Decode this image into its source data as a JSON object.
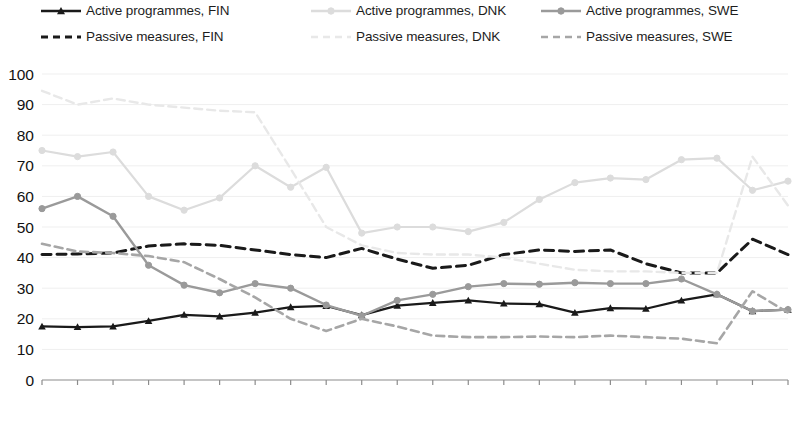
{
  "chart_data": {
    "type": "line",
    "title": "",
    "subtitle": "",
    "xlabel": "",
    "ylabel": "",
    "ylim": [
      0,
      100
    ],
    "ytick_step": 10,
    "yticks": [
      "0",
      "10",
      "20",
      "30",
      "40",
      "50",
      "60",
      "70",
      "80",
      "90",
      "100"
    ],
    "grid": true,
    "grid_axis": "y",
    "legend_position": "top",
    "legend_columns": 3,
    "legend_rows": 2,
    "categories": [
      "2000",
      "2001",
      "2002",
      "2003",
      "2004",
      "2005",
      "2006",
      "2007",
      "2008",
      "2009",
      "2010",
      "2011",
      "2012",
      "2013",
      "2014",
      "2015",
      "2016",
      "2017",
      "2018",
      "2019",
      "2020",
      "2021"
    ],
    "xtick_rotation": 90,
    "series": [
      {
        "name": "Active programmes, FIN",
        "key": "active_fin",
        "color": "#1a1a1a",
        "style": "solid",
        "marker": "triangle",
        "width": 2.2,
        "values": [
          17.5,
          17.3,
          17.5,
          19.3,
          21.3,
          20.8,
          22.0,
          23.8,
          24.2,
          21.2,
          24.3,
          25.2,
          26.0,
          25.0,
          24.8,
          22.0,
          23.5,
          23.3,
          26.0,
          28.0,
          22.5,
          23.0
        ]
      },
      {
        "name": "Passive measures, FIN",
        "key": "passive_fin",
        "color": "#1a1a1a",
        "style": "dashed",
        "marker": "none",
        "width": 3.0,
        "values": [
          41.0,
          41.2,
          41.5,
          43.8,
          44.5,
          44.0,
          42.5,
          41.0,
          40.0,
          43.0,
          39.5,
          36.5,
          37.5,
          41.0,
          42.5,
          42.0,
          42.5,
          38.0,
          35.0,
          35.0,
          46.0,
          41.0
        ]
      },
      {
        "name": "Active programmes, DNK",
        "key": "active_dnk",
        "color": "#dcdcdc",
        "style": "solid",
        "marker": "circle",
        "width": 2.2,
        "values": [
          75.0,
          73.0,
          74.5,
          60.0,
          55.5,
          59.5,
          70.0,
          63.0,
          69.5,
          48.0,
          50.0,
          50.0,
          48.5,
          51.5,
          59.0,
          64.5,
          66.0,
          65.5,
          72.0,
          72.5,
          62.0,
          65.0
        ]
      },
      {
        "name": "Passive measures, DNK",
        "key": "passive_dnk",
        "color": "#e8e8e8",
        "style": "dashed",
        "marker": "none",
        "width": 2.4,
        "values": [
          94.5,
          90.0,
          92.0,
          90.0,
          89.0,
          88.0,
          87.5,
          69.0,
          50.0,
          44.0,
          41.5,
          41.0,
          41.0,
          40.0,
          38.0,
          36.0,
          35.5,
          35.5,
          35.0,
          35.0,
          73.0,
          57.0
        ]
      },
      {
        "name": "Active programmes, SWE",
        "key": "active_swe",
        "color": "#9a9a9a",
        "style": "solid",
        "marker": "circle",
        "width": 2.4,
        "values": [
          56.0,
          60.0,
          53.5,
          37.5,
          31.0,
          28.5,
          31.5,
          30.0,
          24.5,
          21.0,
          26.0,
          28.0,
          30.5,
          31.5,
          31.3,
          31.8,
          31.5,
          31.5,
          33.0,
          28.0,
          22.5,
          23.0
        ]
      },
      {
        "name": "Passive measures, SWE",
        "key": "passive_swe",
        "color": "#a6a6a6",
        "style": "dashed",
        "marker": "none",
        "width": 2.6,
        "values": [
          44.5,
          42.0,
          41.5,
          40.5,
          38.5,
          33.0,
          27.0,
          20.0,
          16.0,
          20.0,
          17.5,
          14.5,
          14.0,
          14.0,
          14.2,
          14.0,
          14.5,
          14.0,
          13.5,
          12.0,
          29.0,
          22.0
        ]
      }
    ]
  },
  "legend": {
    "items": [
      {
        "label": "Active programmes, FIN",
        "series_key": "active_fin"
      },
      {
        "label": "Active programmes, DNK",
        "series_key": "active_dnk"
      },
      {
        "label": "Active programmes, SWE",
        "series_key": "active_swe"
      },
      {
        "label": "Passive measures, FIN",
        "series_key": "passive_fin"
      },
      {
        "label": "Passive measures, DNK",
        "series_key": "passive_dnk"
      },
      {
        "label": "Passive measures, SWE",
        "series_key": "passive_swe"
      }
    ]
  },
  "axis_style": {
    "axis_color": "#8c8c8c",
    "grid_color": "#efefef",
    "tick_label_color": "#111111"
  }
}
